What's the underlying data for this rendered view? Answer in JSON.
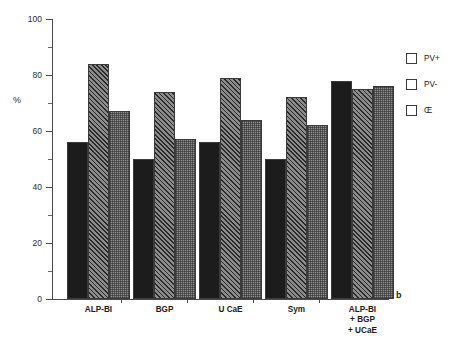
{
  "chart_data": {
    "type": "bar",
    "title": "",
    "xlabel": "",
    "ylabel": "%",
    "ylim": [
      0,
      100
    ],
    "ytick_labels": [
      "0",
      "20",
      "40",
      "60",
      "80",
      "100"
    ],
    "ytick_values": [
      0,
      20,
      40,
      60,
      80,
      100
    ],
    "minor_ticks": true,
    "grid": false,
    "legend_position": "right",
    "panel_label": "b",
    "categories": [
      "ALP-BI",
      "BGP",
      "U CaE",
      "Sym",
      "ALP-BI\n+ BGP\n+ UCaE"
    ],
    "series": [
      {
        "name": "PV+",
        "fill": "solid-black",
        "color": "#1c1c1c",
        "values": [
          56,
          50,
          56,
          50,
          78
        ]
      },
      {
        "name": "PV-",
        "fill": "diagonal-hatch",
        "color": "#8c8c8c",
        "values": [
          84,
          74,
          79,
          72,
          75
        ]
      },
      {
        "name": "Œ",
        "fill": "cross-hatch",
        "color": "#8f8f8f",
        "values": [
          67,
          57,
          64,
          62,
          76
        ]
      }
    ]
  },
  "legend": {
    "items": [
      {
        "label": "PV+"
      },
      {
        "label": "PV-"
      },
      {
        "label": "Œ"
      }
    ]
  }
}
